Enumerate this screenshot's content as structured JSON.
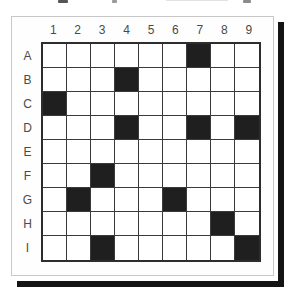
{
  "figure": {
    "description_note": "coordinate puzzle grid figure, caption cropped out of frame at top"
  },
  "grid": {
    "column_labels": [
      "1",
      "2",
      "3",
      "4",
      "5",
      "6",
      "7",
      "8",
      "9"
    ],
    "row_labels": [
      "A",
      "B",
      "C",
      "D",
      "E",
      "F",
      "G",
      "H",
      "I"
    ],
    "filled_cells": [
      "A7",
      "B4",
      "C1",
      "D4",
      "D7",
      "D9",
      "F3",
      "G2",
      "G6",
      "H8",
      "I3",
      "I9"
    ],
    "size": {
      "rows": 9,
      "cols": 9
    }
  },
  "colors": {
    "filled": "#1f1f1f",
    "grid_line": "#3a3a3a",
    "grid_line_outer": "#2d2d2d",
    "label": "#4a4a4a",
    "panel_border": "#c8c8c8",
    "shadow": "#141414",
    "background": "#ffffff"
  }
}
